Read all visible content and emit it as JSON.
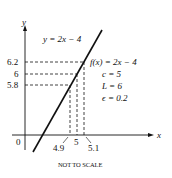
{
  "diagram": {
    "type": "function-graph-epsilon-delta",
    "axes": {
      "x_label": "x",
      "y_label": "y",
      "origin_label": "0"
    },
    "line_label": "y = 2x − 4",
    "annotations": {
      "function": "f(x) = 2x − 4",
      "c": "c = 5",
      "L": "L = 6",
      "epsilon": "ϵ = 0.2"
    },
    "y_ticks": [
      "6.2",
      "6",
      "5.8"
    ],
    "x_ticks": [
      "4.9",
      "5",
      "5.1"
    ],
    "footer": "NOT TO SCALE",
    "colors": {
      "line": "#111111",
      "background": "#ffffff"
    }
  }
}
